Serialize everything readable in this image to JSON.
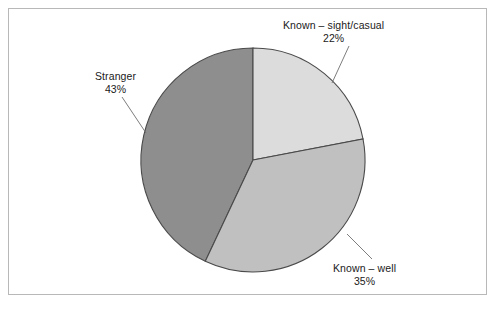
{
  "chart_data": {
    "type": "pie",
    "title": "",
    "subtitle": "",
    "xlabel": "",
    "ylabel": "",
    "legend_position": "none",
    "grid": false,
    "start_angle_deg": 90,
    "direction": "clockwise",
    "labels_outside": true,
    "categories": [
      "Known – sight/casual",
      "Known – well",
      "Stranger"
    ],
    "values": [
      22,
      35,
      43
    ],
    "value_suffix": "%",
    "slices": [
      {
        "label": "Known – sight/casual",
        "value": 22,
        "value_text": "22%",
        "color": "#dcdcdc",
        "leader_line": true
      },
      {
        "label": "Known – well",
        "value": 35,
        "value_text": "35%",
        "color": "#c0c0c0",
        "leader_line": true
      },
      {
        "label": "Stranger",
        "value": 43,
        "value_text": "43%",
        "color": "#8e8e8e",
        "leader_line": true
      }
    ]
  },
  "figure": {
    "frame_color": "#b8b8b8",
    "background": "#ffffff",
    "slice_outline_color": "#4a4a4a",
    "leader_line_color": "#6e6e6e"
  }
}
